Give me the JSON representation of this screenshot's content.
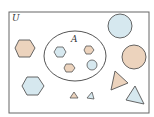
{
  "diagram": {
    "type": "venn",
    "universal_set": {
      "label": "U"
    },
    "subset": {
      "label": "A"
    },
    "colors": {
      "tan": "#ecd3bd",
      "blue": "#d6e8ef",
      "stroke": "#555555",
      "frame": "#666666"
    },
    "shapes_in_A": [
      {
        "shape": "hexagon",
        "color": "blue"
      },
      {
        "shape": "hexagon",
        "color": "tan"
      },
      {
        "shape": "hexagon",
        "color": "tan"
      },
      {
        "shape": "circle",
        "color": "blue"
      }
    ],
    "shapes_outside_A": [
      {
        "shape": "hexagon",
        "color": "tan",
        "size": "large"
      },
      {
        "shape": "hexagon",
        "color": "blue",
        "size": "large"
      },
      {
        "shape": "circle",
        "color": "blue",
        "size": "large"
      },
      {
        "shape": "circle",
        "color": "tan",
        "size": "large"
      },
      {
        "shape": "triangle",
        "color": "tan",
        "size": "large"
      },
      {
        "shape": "triangle",
        "color": "blue",
        "size": "large"
      },
      {
        "shape": "triangle",
        "color": "tan",
        "size": "small"
      },
      {
        "shape": "triangle",
        "color": "blue",
        "size": "small"
      }
    ]
  }
}
